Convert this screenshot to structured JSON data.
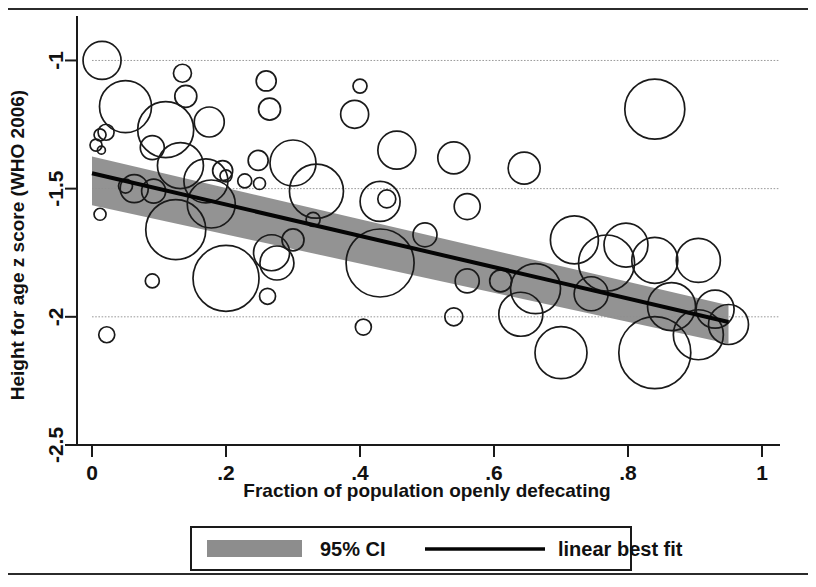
{
  "figure": {
    "top_rule": "horizontal-rule",
    "bottom_rule": "horizontal-rule"
  },
  "chart_data": {
    "type": "scatter",
    "title": "",
    "xlabel": "Fraction of population openly defecating",
    "ylabel": "Height for age z score (WHO 2006)",
    "xlim": [
      0,
      1
    ],
    "ylim": [
      -2.5,
      -0.85
    ],
    "grid": true,
    "xticks": [
      0,
      0.2,
      0.4,
      0.6,
      0.8,
      1
    ],
    "xticklabels": [
      "0",
      ".2",
      ".4",
      ".6",
      ".8",
      "1"
    ],
    "yticks": [
      -1,
      -1.5,
      -2,
      -2.5
    ],
    "yticklabels": [
      "-1",
      "-1.5",
      "-2",
      "-2.5"
    ],
    "legend": {
      "position": "below-axes",
      "entries": [
        {
          "label": "95% CI",
          "marker": "band",
          "color": "#8d8d8d"
        },
        {
          "label": "linear best fit",
          "marker": "line",
          "color": "#050505"
        }
      ]
    },
    "fit_line": {
      "name": "linear best fit",
      "x": [
        0,
        0.95
      ],
      "y": [
        -1.44,
        -2.02
      ],
      "slope": -0.611,
      "intercept": -1.44
    },
    "ci_band": {
      "name": "95% CI",
      "x": [
        0,
        0.95
      ],
      "upper": [
        -1.375,
        -1.955
      ],
      "lower": [
        -1.565,
        -2.105
      ]
    },
    "bubbles": [
      {
        "x": 0.015,
        "y": -1.0,
        "r": 19
      },
      {
        "x": 0.05,
        "y": -1.18,
        "r": 26
      },
      {
        "x": 0.135,
        "y": -1.05,
        "r": 9
      },
      {
        "x": 0.14,
        "y": -1.14,
        "r": 11
      },
      {
        "x": 0.11,
        "y": -1.27,
        "r": 28
      },
      {
        "x": 0.175,
        "y": -1.24,
        "r": 15
      },
      {
        "x": 0.012,
        "y": -1.29,
        "r": 6
      },
      {
        "x": 0.021,
        "y": -1.28,
        "r": 8
      },
      {
        "x": 0.006,
        "y": -1.33,
        "r": 6
      },
      {
        "x": 0.014,
        "y": -1.35,
        "r": 4
      },
      {
        "x": 0.09,
        "y": -1.34,
        "r": 12
      },
      {
        "x": 0.26,
        "y": -1.08,
        "r": 10
      },
      {
        "x": 0.265,
        "y": -1.19,
        "r": 11
      },
      {
        "x": 0.4,
        "y": -1.1,
        "r": 7
      },
      {
        "x": 0.392,
        "y": -1.21,
        "r": 14
      },
      {
        "x": 0.455,
        "y": -1.35,
        "r": 19
      },
      {
        "x": 0.54,
        "y": -1.38,
        "r": 16
      },
      {
        "x": 0.3,
        "y": -1.4,
        "r": 23
      },
      {
        "x": 0.248,
        "y": -1.39,
        "r": 10
      },
      {
        "x": 0.645,
        "y": -1.42,
        "r": 16
      },
      {
        "x": 0.84,
        "y": -1.19,
        "r": 30
      },
      {
        "x": 0.132,
        "y": -1.41,
        "r": 23
      },
      {
        "x": 0.195,
        "y": -1.43,
        "r": 10
      },
      {
        "x": 0.2,
        "y": -1.45,
        "r": 6
      },
      {
        "x": 0.17,
        "y": -1.47,
        "r": 22
      },
      {
        "x": 0.228,
        "y": -1.47,
        "r": 7
      },
      {
        "x": 0.25,
        "y": -1.48,
        "r": 6
      },
      {
        "x": 0.063,
        "y": -1.5,
        "r": 14
      },
      {
        "x": 0.092,
        "y": -1.51,
        "r": 12
      },
      {
        "x": 0.05,
        "y": -1.49,
        "r": 7
      },
      {
        "x": 0.335,
        "y": -1.51,
        "r": 27
      },
      {
        "x": 0.44,
        "y": -1.54,
        "r": 9
      },
      {
        "x": 0.43,
        "y": -1.55,
        "r": 20
      },
      {
        "x": 0.56,
        "y": -1.57,
        "r": 13
      },
      {
        "x": 0.178,
        "y": -1.56,
        "r": 24
      },
      {
        "x": 0.012,
        "y": -1.6,
        "r": 6
      },
      {
        "x": 0.33,
        "y": -1.62,
        "r": 7
      },
      {
        "x": 0.125,
        "y": -1.66,
        "r": 30
      },
      {
        "x": 0.497,
        "y": -1.68,
        "r": 12
      },
      {
        "x": 0.3,
        "y": -1.7,
        "r": 11
      },
      {
        "x": 0.72,
        "y": -1.7,
        "r": 24
      },
      {
        "x": 0.797,
        "y": -1.72,
        "r": 22
      },
      {
        "x": 0.268,
        "y": -1.75,
        "r": 18
      },
      {
        "x": 0.276,
        "y": -1.79,
        "r": 17
      },
      {
        "x": 0.43,
        "y": -1.79,
        "r": 34
      },
      {
        "x": 0.768,
        "y": -1.79,
        "r": 28
      },
      {
        "x": 0.84,
        "y": -1.78,
        "r": 23
      },
      {
        "x": 0.905,
        "y": -1.78,
        "r": 22
      },
      {
        "x": 0.2,
        "y": -1.85,
        "r": 33
      },
      {
        "x": 0.56,
        "y": -1.86,
        "r": 12
      },
      {
        "x": 0.61,
        "y": -1.86,
        "r": 11
      },
      {
        "x": 0.662,
        "y": -1.89,
        "r": 25
      },
      {
        "x": 0.745,
        "y": -1.91,
        "r": 17
      },
      {
        "x": 0.262,
        "y": -1.92,
        "r": 8
      },
      {
        "x": 0.09,
        "y": -1.86,
        "r": 7
      },
      {
        "x": 0.405,
        "y": -2.04,
        "r": 8
      },
      {
        "x": 0.54,
        "y": -2.0,
        "r": 9
      },
      {
        "x": 0.64,
        "y": -1.99,
        "r": 22
      },
      {
        "x": 0.865,
        "y": -1.96,
        "r": 24
      },
      {
        "x": 0.93,
        "y": -1.97,
        "r": 19
      },
      {
        "x": 0.95,
        "y": -2.03,
        "r": 20
      },
      {
        "x": 0.905,
        "y": -2.07,
        "r": 25
      },
      {
        "x": 0.7,
        "y": -2.14,
        "r": 26
      },
      {
        "x": 0.84,
        "y": -2.14,
        "r": 36
      },
      {
        "x": 0.022,
        "y": -2.07,
        "r": 8
      }
    ]
  }
}
